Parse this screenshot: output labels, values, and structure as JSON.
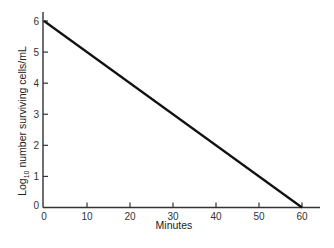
{
  "chart_data": {
    "type": "line",
    "title": "",
    "xlabel": "Minutes",
    "ylabel_main": "Log",
    "ylabel_sub": "10",
    "ylabel_rest": " number surviving cells/mL",
    "ylabel": "Log10 number surviving cells/mL",
    "x_ticks": [
      0,
      10,
      20,
      30,
      40,
      50,
      60
    ],
    "y_ticks": [
      0,
      1,
      2,
      3,
      4,
      5,
      6
    ],
    "xlim": [
      0,
      63
    ],
    "ylim": [
      0,
      6.3
    ],
    "grid": false,
    "legend": null,
    "series": [
      {
        "name": "survival",
        "x": [
          0,
          60
        ],
        "y": [
          6,
          0
        ]
      }
    ]
  }
}
